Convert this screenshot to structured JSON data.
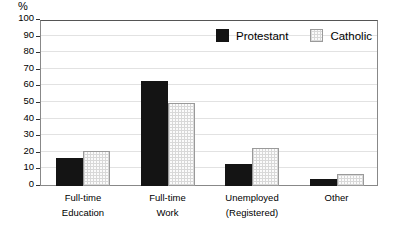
{
  "chart_data": {
    "type": "bar",
    "title": "",
    "xlabel": "",
    "ylabel": "%",
    "ylim": [
      0,
      100
    ],
    "yticks": [
      0,
      10,
      20,
      30,
      40,
      50,
      60,
      70,
      80,
      90,
      100
    ],
    "grid": true,
    "legend_position": "top-right-inside",
    "categories": [
      "Full-time Education",
      "Full-time Work",
      "Unemployed (Registered)",
      "Other"
    ],
    "category_lines": [
      {
        "line1": "Full-time",
        "line2": "Education"
      },
      {
        "line1": "Full-time",
        "line2": "Work"
      },
      {
        "line1": "Unemployed",
        "line2": "(Registered)"
      },
      {
        "line1": "Other",
        "line2": ""
      }
    ],
    "series": [
      {
        "name": "Protestant",
        "color": "#141414",
        "values": [
          17,
          63,
          13,
          4
        ]
      },
      {
        "name": "Catholic",
        "color": "#fbfbfb",
        "values": [
          21,
          50,
          23,
          7
        ]
      }
    ]
  },
  "axis": {
    "unit_label": "%",
    "tick_labels": [
      "100",
      "90",
      "80",
      "70",
      "60",
      "50",
      "40",
      "30",
      "20",
      "10",
      "0"
    ]
  },
  "legend": {
    "items": [
      {
        "label": "Protestant",
        "swatch": "solid-black-swatch"
      },
      {
        "label": "Catholic",
        "swatch": "dotted-light-swatch"
      }
    ]
  }
}
